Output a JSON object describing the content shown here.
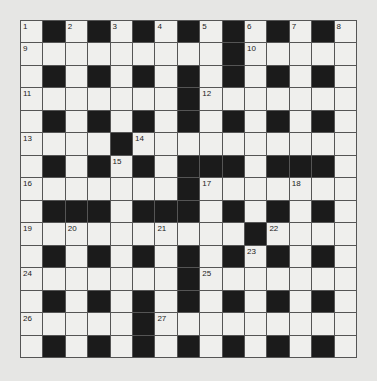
{
  "puzzle": {
    "title": "Crossword grid",
    "size": 15,
    "legend": {
      "block": "#",
      "open": "."
    },
    "rows": [
      ".#.#.#.#.#.#.#.",
      ".........#.....",
      ".#.#.#.#.#.#.#.",
      ".......#.......",
      ".#.#.#.#.#.#.#.",
      "....#..........",
      ".#.#.#.###.###.",
      ".......#.......",
      ".###.###.#.#.#.",
      "..........#....",
      ".#.#.#.#.#.#.#.",
      ".......#.......",
      ".#.#.#.#.#.#.#.",
      ".....#.........",
      ".#.#.#.#.#.#.#."
    ],
    "clue_numbers": [
      {
        "n": "1",
        "row": 0,
        "col": 0
      },
      {
        "n": "2",
        "row": 0,
        "col": 2
      },
      {
        "n": "3",
        "row": 0,
        "col": 4
      },
      {
        "n": "4",
        "row": 0,
        "col": 6
      },
      {
        "n": "5",
        "row": 0,
        "col": 8
      },
      {
        "n": "6",
        "row": 0,
        "col": 10
      },
      {
        "n": "7",
        "row": 0,
        "col": 12
      },
      {
        "n": "8",
        "row": 0,
        "col": 14
      },
      {
        "n": "9",
        "row": 1,
        "col": 0
      },
      {
        "n": "10",
        "row": 1,
        "col": 10
      },
      {
        "n": "11",
        "row": 3,
        "col": 0
      },
      {
        "n": "12",
        "row": 3,
        "col": 8
      },
      {
        "n": "13",
        "row": 5,
        "col": 0
      },
      {
        "n": "14",
        "row": 5,
        "col": 5
      },
      {
        "n": "15",
        "row": 6,
        "col": 4
      },
      {
        "n": "16",
        "row": 7,
        "col": 0
      },
      {
        "n": "17",
        "row": 7,
        "col": 8
      },
      {
        "n": "18",
        "row": 7,
        "col": 12
      },
      {
        "n": "19",
        "row": 9,
        "col": 0
      },
      {
        "n": "20",
        "row": 9,
        "col": 2
      },
      {
        "n": "21",
        "row": 9,
        "col": 6
      },
      {
        "n": "22",
        "row": 9,
        "col": 11
      },
      {
        "n": "23",
        "row": 10,
        "col": 10
      },
      {
        "n": "24",
        "row": 11,
        "col": 0
      },
      {
        "n": "25",
        "row": 11,
        "col": 8
      },
      {
        "n": "26",
        "row": 13,
        "col": 0
      },
      {
        "n": "27",
        "row": 13,
        "col": 6
      }
    ]
  }
}
